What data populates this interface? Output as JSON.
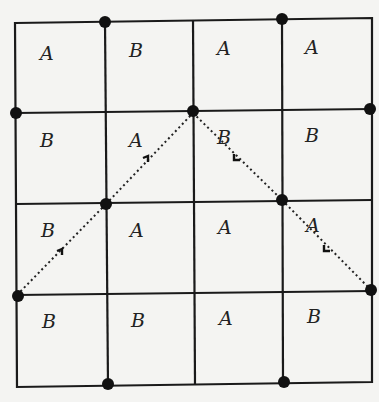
{
  "diagram": {
    "grid": {
      "rows": 4,
      "cols": 4
    },
    "cells": [
      [
        "A",
        "B",
        "A",
        "A"
      ],
      [
        "B",
        "A",
        "B",
        "B"
      ],
      [
        "B",
        "A",
        "A",
        "A"
      ],
      [
        "B",
        "B",
        "A",
        "B"
      ]
    ],
    "colors": {
      "line": "#1a1a1a",
      "dot": "#111111",
      "background": "#f4f4f2"
    }
  }
}
